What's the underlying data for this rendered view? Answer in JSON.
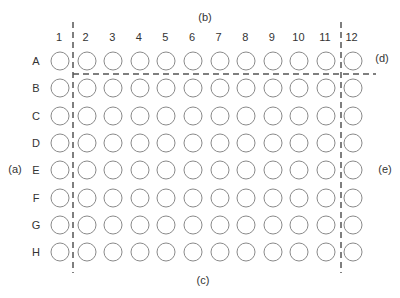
{
  "diagram": {
    "type": "96-well plate layout",
    "columns": [
      "1",
      "2",
      "3",
      "4",
      "5",
      "6",
      "7",
      "8",
      "9",
      "10",
      "11",
      "12"
    ],
    "rows": [
      "A",
      "B",
      "C",
      "D",
      "E",
      "F",
      "G",
      "H"
    ],
    "annotations": {
      "a": "(a)",
      "b": "(b)",
      "c": "(c)",
      "d": "(d)",
      "e": "(e)"
    },
    "divider_lines": [
      {
        "name": "left-vertical",
        "orientation": "vertical",
        "between_columns": [
          "1",
          "2"
        ]
      },
      {
        "name": "right-vertical",
        "orientation": "vertical",
        "between_columns": [
          "11",
          "12"
        ]
      },
      {
        "name": "top-horizontal",
        "orientation": "horizontal",
        "between_rows": [
          "A",
          "B"
        ],
        "from_column": "2"
      }
    ],
    "colors": {
      "well_outline": "#8a8a8a",
      "dashed_line": "#555555",
      "text": "#333333"
    }
  }
}
